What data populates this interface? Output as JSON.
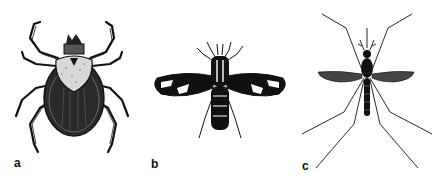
{
  "figure": {
    "panels": [
      {
        "id": "a",
        "label": "a",
        "subject": "tick"
      },
      {
        "id": "b",
        "label": "b",
        "subject": "fly"
      },
      {
        "id": "c",
        "label": "c",
        "subject": "mosquito"
      }
    ],
    "colors": {
      "background": "#ffffff",
      "ink": "#111111"
    }
  }
}
